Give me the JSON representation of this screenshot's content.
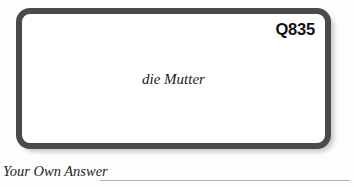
{
  "card": {
    "id_label": "Q835",
    "term": "die Mutter",
    "border_color": "#4a4a4a",
    "fill_color": "#ffffff"
  },
  "answer": {
    "label": "Your Own Answer",
    "rule_color": "#b0b0b0"
  },
  "page": {
    "background_color": "#fdfdfd"
  }
}
